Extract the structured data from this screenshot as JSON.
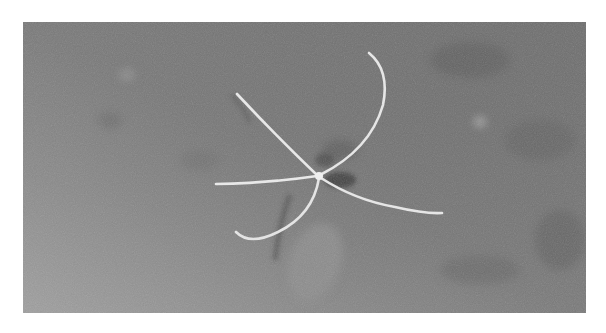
{
  "photo": {
    "subject": "brittle-star",
    "scene": "seafloor",
    "colors": {
      "seafloor_dark": "#6e6e6e",
      "seafloor_mid": "#7a7a7a",
      "seafloor_light": "#9c9c9c",
      "arm": "#e6e6e6",
      "shadow": "#3e3e3e"
    }
  }
}
